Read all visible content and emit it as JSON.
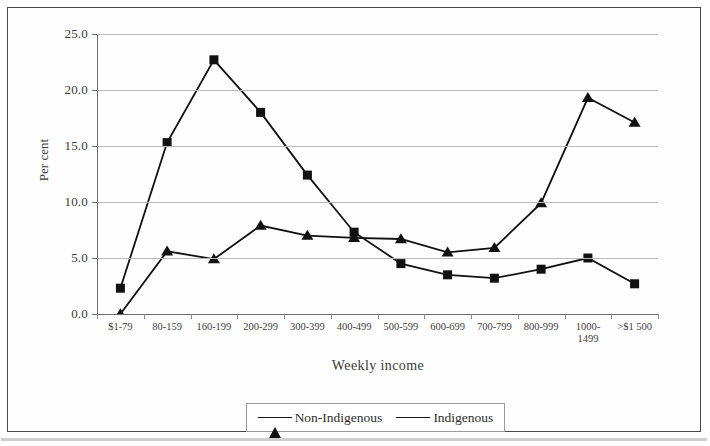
{
  "chart_data": {
    "type": "line",
    "title": "",
    "xlabel": "Weekly income",
    "ylabel": "Per cent",
    "ylim": [
      0,
      25
    ],
    "ytick_labels": [
      "0.0",
      "5.0",
      "10.0",
      "15.0",
      "20.0",
      "25.0"
    ],
    "ytick_values": [
      0,
      5,
      10,
      15,
      20,
      25
    ],
    "grid": true,
    "legend_position": "bottom-center",
    "categories": [
      "$1-79",
      "80-159",
      "160-199",
      "200-299",
      "300-399",
      "400-499",
      "500-599",
      "600-699",
      "700-799",
      "800-999",
      "1000-\n1499",
      ">$1 500"
    ],
    "series": [
      {
        "name": "Non-Indigenous",
        "marker": "triangle",
        "values": [
          0.0,
          5.6,
          4.9,
          7.9,
          7.0,
          6.8,
          6.7,
          5.5,
          5.9,
          9.9,
          19.3,
          17.1
        ]
      },
      {
        "name": "Indigenous",
        "marker": "square",
        "values": [
          2.3,
          15.3,
          22.7,
          18.0,
          12.4,
          7.3,
          4.5,
          3.5,
          3.2,
          4.0,
          5.0,
          2.7
        ]
      }
    ]
  },
  "legend": {
    "entries": [
      {
        "label": "Non-Indigenous",
        "marker": "triangle"
      },
      {
        "label": "Indigenous",
        "marker": "square"
      }
    ]
  },
  "colors": {
    "series_line": "#111111",
    "gridline": "#b9b9b9",
    "axis": "#6d6d6d",
    "text": "#3a3a3a",
    "frame": "#4a4a4a"
  }
}
